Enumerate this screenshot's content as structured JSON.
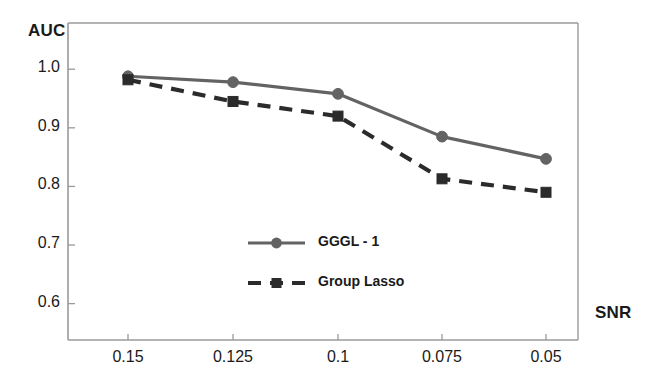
{
  "chart_data": {
    "type": "line",
    "title": "",
    "xlabel": "SNR",
    "ylabel": "AUC",
    "x": [
      0.15,
      0.125,
      0.1,
      0.075,
      0.05
    ],
    "categories": [
      "0.15",
      "0.125",
      "0.1",
      "0.075",
      "0.05"
    ],
    "xtick_labels": [
      "0.15",
      "0.125",
      "0.1",
      "0.075",
      "0.05"
    ],
    "ytick_labels": [
      "1.0",
      "0.9",
      "0.8",
      "0.7",
      "0.6"
    ],
    "yticks": [
      1.0,
      0.9,
      0.8,
      0.7,
      0.6
    ],
    "ylim": [
      0.555,
      1.055
    ],
    "grid": false,
    "legend_position": "center",
    "series": [
      {
        "name": "GGGL - 1",
        "values": [
          0.988,
          0.978,
          0.958,
          0.885,
          0.847
        ],
        "color": "#636363",
        "style": "solid",
        "marker": "circle"
      },
      {
        "name": "Group Lasso",
        "values": [
          0.982,
          0.945,
          0.92,
          0.813,
          0.79
        ],
        "color": "#2b2b2b",
        "style": "dashed",
        "marker": "square"
      }
    ]
  },
  "axes": {
    "y_title": "AUC",
    "x_title": "SNR",
    "frame_color": "#8a8a8a"
  },
  "legend": {
    "items": [
      {
        "label": "GGGL - 1"
      },
      {
        "label": "Group Lasso"
      }
    ]
  }
}
